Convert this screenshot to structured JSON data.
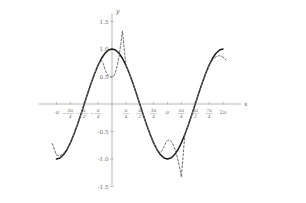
{
  "figure": {
    "axis_labels": {
      "x": "x",
      "y": "y"
    },
    "origin_px": {
      "x": 112,
      "y": 104
    },
    "scale_px_per_unit_y": 55,
    "scale_px_per_pi_x": 55.5
  },
  "chart_data": {
    "type": "line",
    "title": "",
    "xlabel": "x",
    "ylabel": "y",
    "grid": false,
    "legend": null,
    "xlim": [
      -3.14159,
      6.28319
    ],
    "ylim": [
      -1.5,
      1.5
    ],
    "xticks": [
      -3.14159,
      -2.35619,
      -1.5708,
      -0.7854,
      0.7854,
      1.5708,
      2.35619,
      3.14159,
      3.92699,
      4.71239,
      5.49779,
      6.28319
    ],
    "xticklabels": [
      {
        "type": "whole",
        "text": "-π"
      },
      {
        "type": "fraction",
        "sign": "-",
        "num": "3π",
        "den": "4"
      },
      {
        "type": "fraction",
        "sign": "-",
        "num": "π",
        "den": "2"
      },
      {
        "type": "fraction",
        "sign": "-",
        "num": "π",
        "den": "4"
      },
      {
        "type": "fraction",
        "sign": "",
        "num": "π",
        "den": "4"
      },
      {
        "type": "fraction",
        "sign": "",
        "num": "π",
        "den": "2"
      },
      {
        "type": "fraction",
        "sign": "",
        "num": "3π",
        "den": "4"
      },
      {
        "type": "whole",
        "text": "π"
      },
      {
        "type": "fraction",
        "sign": "",
        "num": "5π",
        "den": "4"
      },
      {
        "type": "fraction",
        "sign": "",
        "num": "3π",
        "den": "2"
      },
      {
        "type": "fraction",
        "sign": "",
        "num": "7π",
        "den": "4"
      },
      {
        "type": "whole",
        "text": "2π"
      }
    ],
    "yticks": [
      -1.5,
      -1.0,
      -0.5,
      0.5,
      1.0,
      1.5
    ],
    "yticklabels": [
      "-1.5",
      "-1.0",
      "-0.5",
      "0.5",
      "1.0",
      "1.5"
    ],
    "series": [
      {
        "name": "cos(x)",
        "style": "solid",
        "color": "#1a1a1a",
        "x": [
          -3.14159,
          -2.94524,
          -2.74889,
          -2.55254,
          -2.35619,
          -2.15984,
          -1.9635,
          -1.76715,
          -1.5708,
          -1.37445,
          -1.1781,
          -0.98175,
          -0.7854,
          -0.58905,
          -0.3927,
          -0.19635,
          0.0,
          0.19635,
          0.3927,
          0.58905,
          0.7854,
          0.98175,
          1.1781,
          1.37445,
          1.5708,
          1.76715,
          1.9635,
          2.15984,
          2.35619,
          2.55254,
          2.74889,
          2.94524,
          3.14159,
          3.33794,
          3.53429,
          3.73064,
          3.92699,
          4.12334,
          4.31969,
          4.51604,
          4.71239,
          4.90874,
          5.10509,
          5.30144,
          5.49779,
          5.69414,
          5.89049,
          6.08684,
          6.28319
        ],
        "y": [
          -1.0,
          -0.98079,
          -0.92388,
          -0.83147,
          -0.70711,
          -0.55557,
          -0.38268,
          -0.19509,
          0.0,
          0.19509,
          0.38268,
          0.55557,
          0.70711,
          0.83147,
          0.92388,
          0.98079,
          1.0,
          0.98079,
          0.92388,
          0.83147,
          0.70711,
          0.55557,
          0.38268,
          0.19509,
          0.0,
          -0.19509,
          -0.38268,
          -0.55557,
          -0.70711,
          -0.83147,
          -0.92388,
          -0.98079,
          -1.0,
          -0.98079,
          -0.92388,
          -0.83147,
          -0.70711,
          -0.55557,
          -0.38268,
          -0.19509,
          0.0,
          0.19509,
          0.38268,
          0.55557,
          0.70711,
          0.83147,
          0.92388,
          0.98079,
          1.0
        ]
      },
      {
        "name": "approximation",
        "style": "dashed",
        "color": "#6e6e6e",
        "note": "overlays cos(x) across mid-range, diverges upward near x=0 and x=pi and downward past the endpoints",
        "x": [
          -3.38,
          -3.14159,
          -2.94524,
          -2.74889,
          -2.55254,
          -2.35619,
          -2.15984,
          -1.9635,
          -1.76715,
          -1.5708,
          -1.37445,
          -1.1781,
          -0.98175,
          -0.7854,
          -0.68,
          -0.58905,
          -0.5,
          -0.42,
          -0.34,
          -0.26,
          -0.18,
          -0.1,
          -0.04,
          0.0,
          0.06,
          0.12,
          0.2,
          0.3,
          0.3927,
          0.5,
          0.58905,
          0.7854,
          0.98175,
          1.1781,
          1.37445,
          1.5708,
          1.76715,
          1.9635,
          2.15984,
          2.35619,
          2.55254,
          2.7,
          2.82,
          2.92,
          3.0,
          3.08,
          3.14159,
          3.22,
          3.3,
          3.4,
          3.52,
          3.64,
          3.76,
          3.88,
          3.92699,
          4.12334,
          4.31969,
          4.51604,
          4.71239,
          4.90874,
          5.10509,
          5.30144,
          5.49779,
          5.69414,
          5.89049,
          6.08684,
          6.28319,
          6.45
        ],
        "y": [
          -0.72,
          -0.93,
          -0.94,
          -0.9,
          -0.82,
          -0.705,
          -0.555,
          -0.383,
          -0.195,
          0.0,
          0.195,
          0.383,
          0.555,
          0.707,
          0.765,
          0.79,
          0.74,
          0.655,
          0.585,
          0.535,
          0.505,
          0.492,
          0.49,
          0.492,
          0.5,
          0.52,
          0.58,
          0.7,
          0.855,
          1.1,
          1.33,
          0.707,
          0.556,
          0.383,
          0.195,
          0.0,
          -0.195,
          -0.383,
          -0.556,
          -0.707,
          -0.831,
          -0.88,
          -0.855,
          -0.79,
          -0.735,
          -0.685,
          -0.665,
          -0.655,
          -0.665,
          -0.7,
          -0.785,
          -0.9,
          -1.05,
          -1.24,
          -1.33,
          -0.556,
          -0.383,
          -0.195,
          0.0,
          0.195,
          0.383,
          0.556,
          0.707,
          0.8,
          0.86,
          0.88,
          0.855,
          0.8
        ]
      }
    ]
  }
}
